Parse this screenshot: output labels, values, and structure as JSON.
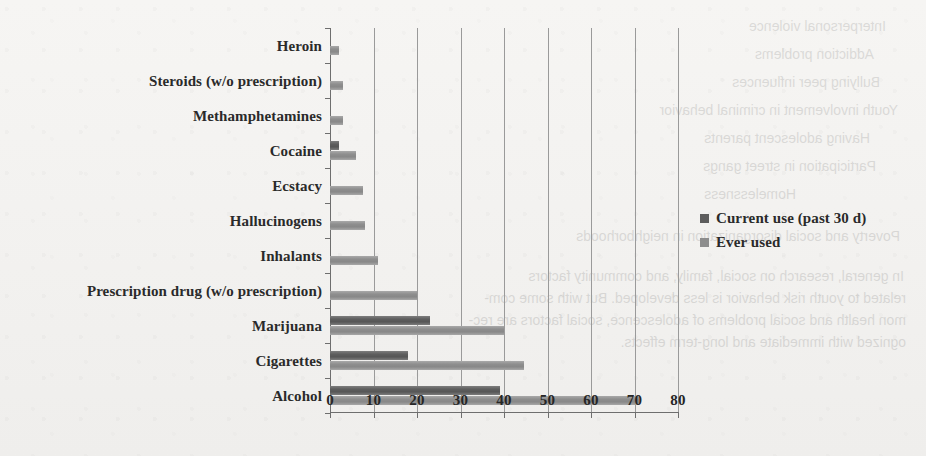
{
  "chart_data": {
    "type": "bar",
    "orientation": "horizontal",
    "title": "",
    "xlabel": "",
    "ylabel": "",
    "xlim": [
      0,
      80
    ],
    "xticks": [
      0,
      10,
      20,
      30,
      40,
      50,
      60,
      70,
      80
    ],
    "grid": "vertical",
    "legend_position": "right",
    "categories": [
      "Heroin",
      "Steroids (w/o prescription)",
      "Methamphetamines",
      "Cocaine",
      "Ecstacy",
      "Hallucinogens",
      "Inhalants",
      "Prescription drug (w/o prescription)",
      "Marijuana",
      "Cigarettes",
      "Alcohol"
    ],
    "series": [
      {
        "name": "Current use (past 30 d)",
        "color": "#5d5d5d",
        "values": [
          0,
          0,
          0,
          2,
          0,
          0,
          0,
          0,
          23,
          18,
          39
        ]
      },
      {
        "name": "Ever used",
        "color": "#8d8d8d",
        "values": [
          2,
          3,
          3,
          6,
          7.5,
          8,
          11,
          20,
          40,
          44.5,
          71
        ]
      }
    ]
  },
  "legend": {
    "items": [
      {
        "label": "Current use  (past 30 d)",
        "swatch": "dark"
      },
      {
        "label": "Ever used",
        "swatch": "light"
      }
    ]
  },
  "bleed_through": {
    "note": "faint mirrored text showing through from the reverse side of the scanned page",
    "lines": [
      "Interpersonal violence",
      "Addiction  problems",
      "Bullying peer influences",
      "Youth involvement in criminal behavior",
      "Having adolescent parents",
      "Participation in street gangs",
      "Homelessness",
      "Poverty and social disorganization in neighborhoods",
      "In general, research on social, family, and community factors",
      "related to youth  risk behavior is less developed.  But with some com-",
      "mon health and social problems of adolescence, social factors are rec-",
      "ognized with immediate and long-term effects."
    ]
  }
}
